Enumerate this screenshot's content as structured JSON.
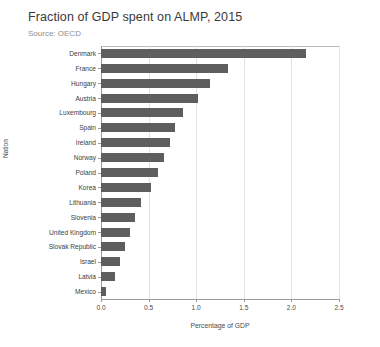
{
  "chart_data": {
    "type": "bar",
    "orientation": "horizontal",
    "title": "Fraction of GDP spent on ALMP, 2015",
    "subtitle": "Source: OECD",
    "xlabel": "Percentage of GDP",
    "ylabel": "Nation",
    "xlim": [
      0.0,
      2.5
    ],
    "xticks": [
      "0.0",
      "0.5",
      "1.0",
      "1.5",
      "2.0",
      "2.5"
    ],
    "xtick_values": [
      0.0,
      0.5,
      1.0,
      1.5,
      2.0,
      2.5
    ],
    "grid": true,
    "legend": "none",
    "bar_color": "#5e5e5e",
    "categories": [
      "Denmark",
      "France",
      "Hungary",
      "Austria",
      "Luxembourg",
      "Spain",
      "Ireland",
      "Norway",
      "Poland",
      "Korea",
      "Lithuania",
      "Slovenia",
      "United Kingdom",
      "Slovak Republic",
      "Israel",
      "Latvia",
      "Mexico"
    ],
    "values": [
      2.15,
      1.33,
      1.15,
      1.02,
      0.86,
      0.78,
      0.72,
      0.66,
      0.6,
      0.52,
      0.42,
      0.36,
      0.3,
      0.25,
      0.2,
      0.15,
      0.05
    ]
  }
}
